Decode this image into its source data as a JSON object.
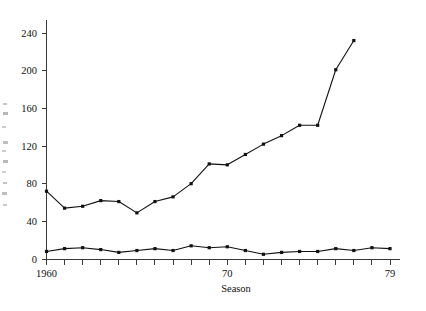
{
  "chart_data": {
    "type": "line",
    "title": "",
    "subtitle": "",
    "xlabel": "Season",
    "ylabel": "",
    "x": [
      1960,
      1961,
      1962,
      1963,
      1964,
      1965,
      1966,
      1967,
      1968,
      1969,
      1970,
      1971,
      1972,
      1973,
      1974,
      1975,
      1976,
      1977,
      1978,
      1979
    ],
    "xtick_values": [
      1960,
      1970,
      1979
    ],
    "xtick_labels": [
      "1960",
      "70",
      "79"
    ],
    "ytick_values": [
      0,
      40,
      80,
      120,
      160,
      200,
      240
    ],
    "ytick_labels": [
      "0",
      "40",
      "80",
      "120",
      "160",
      "200",
      "240"
    ],
    "xlim": [
      1960,
      1979
    ],
    "ylim": [
      0,
      255
    ],
    "grid": false,
    "legend": "none",
    "marker": "filled-square",
    "series": [
      {
        "name": "upper-series",
        "values": [
          72,
          54,
          56,
          62,
          61,
          49,
          61,
          66,
          80,
          101,
          100,
          111,
          122,
          131,
          142,
          142,
          201,
          232,
          null,
          null
        ]
      },
      {
        "name": "lower-series",
        "values": [
          8,
          11,
          12,
          10,
          7,
          9,
          11,
          9,
          14,
          12,
          13,
          9,
          5,
          7,
          8,
          8,
          11,
          9,
          12,
          11
        ]
      }
    ]
  },
  "axes": {
    "x_axis_title": "Season",
    "y_axis_side_note": ""
  }
}
